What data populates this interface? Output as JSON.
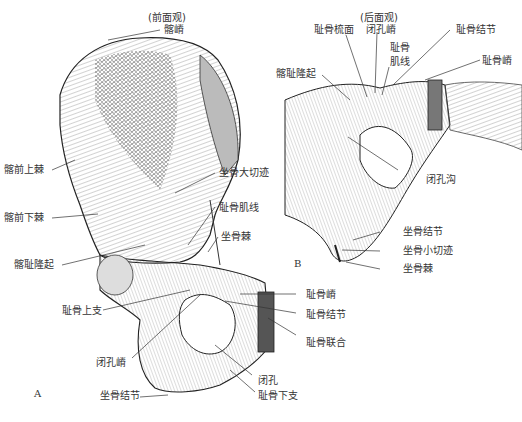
{
  "figure": {
    "panel_a": {
      "letter": "A",
      "view_caption": "(前面观)",
      "labels": {
        "iliac_crest": "髂嵴",
        "asis": "髂前上棘",
        "aiis": "髂前下棘",
        "iliopubic_eminence": "髂耻隆起",
        "greater_sciatic_notch": "坐骨大切迹",
        "pectineal_line": "耻骨肌线",
        "ischial_spine": "坐骨棘",
        "superior_pubic_ramus": "耻骨上支",
        "pubic_crest": "耻骨嵴",
        "pubic_tubercle": "耻骨结节",
        "pubic_symphysis": "耻骨联合",
        "obturator_crest": "闭孔嵴",
        "obturator_foramen": "闭孔",
        "inferior_pubic_ramus": "耻骨下支",
        "ischial_tuberosity": "坐骨结节"
      }
    },
    "panel_b": {
      "letter": "B",
      "view_caption": "(后面观)",
      "labels": {
        "pectineal_surface": "耻骨梳面",
        "obturator_crest": "闭孔嵴",
        "pectineal_line_l1": "耻骨",
        "pectineal_line_l2": "肌线",
        "pubic_tubercle": "耻骨结节",
        "pubic_crest": "耻骨嵴",
        "iliopubic_eminence": "髂耻隆起",
        "obturator_groove": "闭孔沟",
        "ischial_tuberosity": "坐骨结节",
        "lesser_sciatic_notch": "坐骨小切迹",
        "ischial_spine": "坐骨棘"
      }
    }
  }
}
